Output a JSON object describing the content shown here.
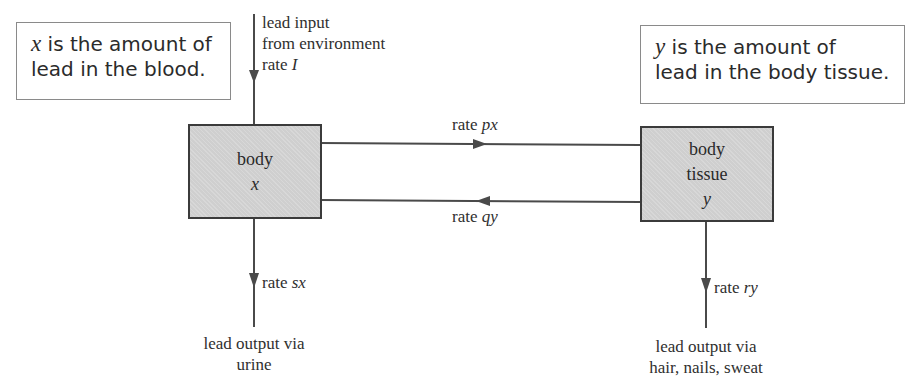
{
  "notes": {
    "blood": {
      "var": "x",
      "line1_rest": " is the amount of",
      "line2": "lead in the blood."
    },
    "tissue": {
      "var": "y",
      "line1_rest": " is the amount of",
      "line2": "lead in the body tissue."
    }
  },
  "compartments": {
    "body": {
      "label": "body",
      "var": "x"
    },
    "tissue": {
      "label_line1": "body",
      "label_line2": "tissue",
      "var": "y"
    }
  },
  "flows": {
    "input": {
      "desc_line1": "lead input",
      "desc_line2": "from environment",
      "rate_prefix": "rate ",
      "rate_var": "I"
    },
    "px": {
      "rate_prefix": "rate ",
      "rate_var": "px"
    },
    "qy": {
      "rate_prefix": "rate ",
      "rate_var": "qy"
    },
    "sx": {
      "rate_prefix": "rate ",
      "rate_var": "sx",
      "desc_line1": "lead output via",
      "desc_line2": "urine"
    },
    "ry": {
      "rate_prefix": "rate ",
      "rate_var": "ry",
      "desc_line1": "lead output via",
      "desc_line2": "hair, nails, sweat"
    }
  },
  "colors": {
    "line": "#4a4a4a",
    "box_fill": "#cfcfcf",
    "box_border": "#3b3b3b",
    "note_border": "#8a8a8a"
  }
}
